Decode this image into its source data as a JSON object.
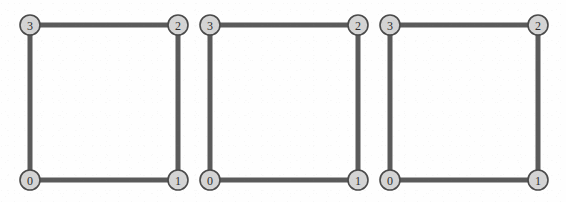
{
  "figure": {
    "type": "graph-diagram",
    "panel_count": 3,
    "colors": {
      "background": "#fefefe",
      "edge": "#5a5a5a",
      "node_fill": "#d4d4d4",
      "node_stroke": "#4a4a4a",
      "label": "#2e2e2e"
    },
    "geometry": {
      "node_radius": 10,
      "edge_width": 5
    },
    "panels": [
      {
        "id": "graph-1",
        "nodes": [
          {
            "label": "0",
            "x": 30,
            "y": 180
          },
          {
            "label": "1",
            "x": 178,
            "y": 180
          },
          {
            "label": "2",
            "x": 178,
            "y": 25
          },
          {
            "label": "3",
            "x": 30,
            "y": 25
          }
        ],
        "edges": [
          {
            "from": "3",
            "to": "2"
          },
          {
            "from": "2",
            "to": "1"
          },
          {
            "from": "1",
            "to": "0"
          },
          {
            "from": "0",
            "to": "3"
          }
        ]
      },
      {
        "id": "graph-2",
        "nodes": [
          {
            "label": "0",
            "x": 210,
            "y": 180
          },
          {
            "label": "1",
            "x": 358,
            "y": 180
          },
          {
            "label": "2",
            "x": 358,
            "y": 25
          },
          {
            "label": "3",
            "x": 210,
            "y": 25
          }
        ],
        "edges": [
          {
            "from": "3",
            "to": "2"
          },
          {
            "from": "2",
            "to": "1"
          },
          {
            "from": "1",
            "to": "0"
          },
          {
            "from": "0",
            "to": "3"
          }
        ]
      },
      {
        "id": "graph-3",
        "nodes": [
          {
            "label": "0",
            "x": 390,
            "y": 180
          },
          {
            "label": "1",
            "x": 538,
            "y": 180
          },
          {
            "label": "2",
            "x": 538,
            "y": 25
          },
          {
            "label": "3",
            "x": 390,
            "y": 25
          }
        ],
        "edges": [
          {
            "from": "3",
            "to": "2"
          },
          {
            "from": "2",
            "to": "1"
          },
          {
            "from": "1",
            "to": "0"
          },
          {
            "from": "0",
            "to": "3"
          }
        ]
      }
    ]
  }
}
